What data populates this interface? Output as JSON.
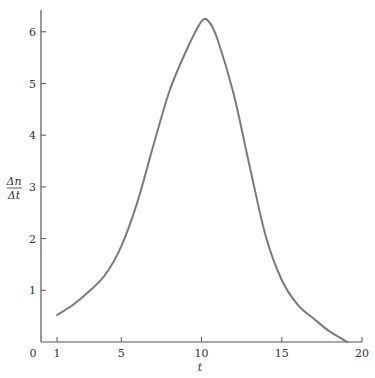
{
  "chart_data": {
    "type": "line",
    "title": "",
    "xlabel": "t",
    "ylabel_numerator": "Δn",
    "ylabel_denominator": "Δt",
    "ylabel": "Δn/Δt",
    "xlim": [
      0,
      20
    ],
    "ylim": [
      0,
      6.4
    ],
    "grid": false,
    "legend": null,
    "origin_label": "0",
    "x_ticks": [
      1,
      5,
      10,
      15,
      20
    ],
    "y_ticks": [
      1,
      2,
      3,
      4,
      5,
      6
    ],
    "series": [
      {
        "name": "Δn/Δt",
        "color": "#7a7a7a",
        "x": [
          1,
          2,
          3,
          4,
          5,
          6,
          7,
          8,
          9,
          10,
          10.5,
          11,
          12,
          13,
          14,
          15,
          16,
          17,
          18,
          19.1
        ],
        "values": [
          0.52,
          0.72,
          0.98,
          1.3,
          1.85,
          2.7,
          3.8,
          4.85,
          5.6,
          6.2,
          6.18,
          5.85,
          4.8,
          3.4,
          2.05,
          1.2,
          0.72,
          0.45,
          0.2,
          0.0
        ]
      }
    ]
  },
  "layout": {
    "x0_px": 41,
    "x_px_per_unit": 16.05,
    "y0_px": 342,
    "y_px_per_unit": 51.7,
    "axis_top_px": 10,
    "axis_right_px": 362,
    "axis_color": "#555555",
    "curve_color": "#7a7a7a"
  }
}
